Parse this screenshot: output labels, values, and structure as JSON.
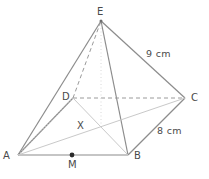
{
  "figure": {
    "colors": {
      "solid_edge": "#8c8c8c",
      "hidden_edge": "#9a9a9a",
      "diagonal": "#c9c9c9",
      "height_line": "#d5d5d5",
      "label": "#4a4a4a",
      "background": "#ffffff",
      "point_fill": "#2b2b2b"
    },
    "vertices": [
      {
        "name": "A",
        "label": "A",
        "x": 18,
        "y": 155,
        "label_x": 3,
        "label_y": 151
      },
      {
        "name": "B",
        "label": "B",
        "x": 128,
        "y": 155,
        "label_x": 134,
        "label_y": 151
      },
      {
        "name": "C",
        "label": "C",
        "x": 185,
        "y": 98,
        "label_x": 191,
        "label_y": 94
      },
      {
        "name": "D",
        "label": "D",
        "x": 73,
        "y": 98,
        "label_x": 62,
        "label_y": 93
      },
      {
        "name": "E",
        "label": "E",
        "x": 101,
        "y": 21,
        "label_x": 97,
        "label_y": 8
      }
    ],
    "marked_points": [
      {
        "name": "X",
        "label": "X",
        "x": 101,
        "y": 126,
        "label_x": 77,
        "label_y": 121,
        "dot": false
      },
      {
        "name": "M",
        "label": "M",
        "x": 72,
        "y": 155,
        "label_x": 68,
        "label_y": 161,
        "dot": true
      }
    ],
    "edges": [
      {
        "name": "AB",
        "from": "A",
        "to": "B",
        "style": "solid"
      },
      {
        "name": "BC",
        "from": "B",
        "to": "C",
        "style": "solid"
      },
      {
        "name": "AE",
        "from": "A",
        "to": "E",
        "style": "solid"
      },
      {
        "name": "BE",
        "from": "B",
        "to": "E",
        "style": "solid"
      },
      {
        "name": "CE",
        "from": "C",
        "to": "E",
        "style": "solid"
      },
      {
        "name": "AD",
        "from": "A",
        "to": "D",
        "style": "solid"
      },
      {
        "name": "DC",
        "from": "D",
        "to": "C",
        "style": "dashed"
      },
      {
        "name": "DE",
        "from": "D",
        "to": "E",
        "style": "dashed"
      },
      {
        "name": "DB",
        "from": "D",
        "to": "B",
        "style": "diagonal"
      },
      {
        "name": "AC",
        "from": "A",
        "to": "C",
        "style": "diagonal"
      },
      {
        "name": "EX",
        "from": "E",
        "to": "X",
        "style": "height"
      }
    ],
    "measurements": [
      {
        "name": "edge-ce-length",
        "text": "9 cm",
        "x": 146,
        "y": 50
      },
      {
        "name": "edge-bc-length",
        "text": "8 cm",
        "x": 157,
        "y": 127
      }
    ]
  }
}
